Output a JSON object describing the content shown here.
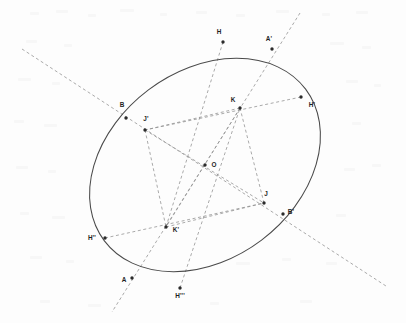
{
  "figure": {
    "kind": "geometric-construction",
    "canvas": {
      "width": 406,
      "height": 323
    },
    "background_color": "#fdfdfd",
    "curve_color": "#4a4a4a",
    "line_color": "#8d8d8d",
    "point_color": "#2b2b2b",
    "label_color": "#1f1f1f"
  },
  "conic": {
    "name": "ellipse",
    "center": {
      "x": 205,
      "y": 165
    },
    "semi_major": 126,
    "semi_minor": 94,
    "rotation_deg": -37
  },
  "points": [
    {
      "id": "H",
      "label": "H",
      "x": 223,
      "y": 42,
      "lx": 219,
      "ly": 34,
      "anchor": "middle"
    },
    {
      "id": "Aprm",
      "label": "A'",
      "x": 272,
      "y": 49,
      "lx": 269,
      "ly": 41,
      "anchor": "middle"
    },
    {
      "id": "Hprm",
      "label": "H'",
      "x": 301,
      "y": 97,
      "lx": 312,
      "ly": 107,
      "anchor": "middle"
    },
    {
      "id": "K",
      "label": "K",
      "x": 240,
      "y": 108,
      "lx": 233,
      "ly": 102,
      "anchor": "middle"
    },
    {
      "id": "B",
      "label": "B",
      "x": 126,
      "y": 118,
      "lx": 122,
      "ly": 107,
      "anchor": "middle"
    },
    {
      "id": "Jprm",
      "label": "J'",
      "x": 145,
      "y": 130,
      "lx": 146,
      "ly": 121,
      "anchor": "middle"
    },
    {
      "id": "O",
      "label": "O",
      "x": 205,
      "y": 165,
      "lx": 214,
      "ly": 167,
      "anchor": "middle"
    },
    {
      "id": "J",
      "label": "J",
      "x": 264,
      "y": 203,
      "lx": 266,
      "ly": 196,
      "anchor": "middle"
    },
    {
      "id": "Bprm",
      "label": "B'",
      "x": 283,
      "y": 214,
      "lx": 291,
      "ly": 214,
      "anchor": "middle"
    },
    {
      "id": "Kprm",
      "label": "K'",
      "x": 166,
      "y": 227,
      "lx": 176,
      "ly": 232,
      "anchor": "middle"
    },
    {
      "id": "Hdbl",
      "label": "H''",
      "x": 105,
      "y": 238,
      "lx": 92,
      "ly": 240,
      "anchor": "middle"
    },
    {
      "id": "A",
      "label": "A",
      "x": 132,
      "y": 278,
      "lx": 124,
      "ly": 282,
      "anchor": "middle"
    },
    {
      "id": "Htrp",
      "label": "H'''",
      "x": 180,
      "y": 288,
      "lx": 180,
      "ly": 298,
      "anchor": "middle"
    }
  ],
  "segments": [
    {
      "id": "axis-B-Bprime",
      "name": "secant-through-B-and-Bprime",
      "x1": 22,
      "y1": 49,
      "x2": 386,
      "y2": 286
    },
    {
      "id": "axis-A-Aprime",
      "name": "secant-through-A-and-Aprime",
      "x1": 300,
      "y1": 13,
      "x2": 112,
      "y2": 312
    },
    {
      "id": "chord-H-Kprime",
      "name": "chord-H-to-Kprime",
      "x1": 223,
      "y1": 42,
      "x2": 166,
      "y2": 227
    },
    {
      "id": "chord-Hprime-Jprime",
      "name": "chord-Hprime-to-Jprime",
      "x1": 301,
      "y1": 97,
      "x2": 145,
      "y2": 130
    },
    {
      "id": "chord-Hdouble-J",
      "name": "chord-Hdoubleprime-to-J",
      "x1": 105,
      "y1": 238,
      "x2": 264,
      "y2": 203
    },
    {
      "id": "chord-Htriple-K",
      "name": "chord-Htripleprime-to-K",
      "x1": 180,
      "y1": 288,
      "x2": 240,
      "y2": 108
    },
    {
      "id": "seg-K-Jprime",
      "name": "segment-K-to-Jprime",
      "x1": 240,
      "y1": 108,
      "x2": 145,
      "y2": 130
    },
    {
      "id": "seg-K-Kprime",
      "name": "segment-K-to-Kprime",
      "x1": 240,
      "y1": 108,
      "x2": 166,
      "y2": 227
    },
    {
      "id": "seg-K-J",
      "name": "segment-K-to-J",
      "x1": 240,
      "y1": 108,
      "x2": 264,
      "y2": 203
    },
    {
      "id": "seg-Jprime-J",
      "name": "segment-Jprime-to-J",
      "x1": 145,
      "y1": 130,
      "x2": 264,
      "y2": 203
    },
    {
      "id": "seg-Jprime-Kprime",
      "name": "segment-Jprime-to-Kprime",
      "x1": 145,
      "y1": 130,
      "x2": 166,
      "y2": 227
    },
    {
      "id": "seg-Kprime-J",
      "name": "segment-Kprime-to-J",
      "x1": 166,
      "y1": 227,
      "x2": 264,
      "y2": 203
    }
  ]
}
